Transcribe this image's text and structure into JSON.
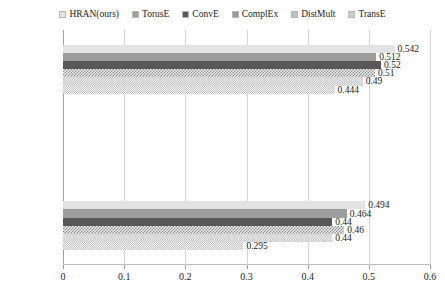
{
  "chart_data": {
    "type": "bar",
    "orientation": "horizontal",
    "title": "",
    "xlabel": "",
    "ylabel": "",
    "categories": [
      "hit@10",
      "hit@3",
      "hit@1"
    ],
    "series": [
      {
        "name": "HRAN(ours)",
        "values": [
          0.542,
          0.494,
          0.45
        ],
        "labels": [
          "0.542",
          "0.494",
          "0.45"
        ],
        "color": "#e3e3e3"
      },
      {
        "name": "TorusE",
        "values": [
          0.512,
          0.464,
          0.422
        ],
        "labels": [
          "0.512",
          "0.464",
          "0.422"
        ],
        "color": "#9d9d9d"
      },
      {
        "name": "ConvE",
        "values": [
          0.52,
          0.44,
          0.4
        ],
        "labels": [
          "0.52",
          "0.44",
          "0.4"
        ],
        "color": "#585858"
      },
      {
        "name": "ComplEx",
        "values": [
          0.51,
          0.46,
          0.41
        ],
        "labels": [
          "0.51",
          "0.46",
          "0.41"
        ],
        "color": "#8e8e8e"
      },
      {
        "name": "DistMult",
        "values": [
          0.49,
          0.44,
          0.39
        ],
        "labels": [
          "0.49",
          "0.44",
          "0.39"
        ],
        "color": "#b9b9b9"
      },
      {
        "name": "TransE",
        "values": [
          0.444,
          0.295,
          0.027
        ],
        "labels": [
          "0.444",
          "0.295",
          "0.027"
        ],
        "color": "#c6c6c6"
      }
    ],
    "xlim": [
      0,
      0.6
    ],
    "xticks": [
      0,
      0.1,
      0.2,
      0.3,
      0.4,
      0.5,
      0.6
    ],
    "xtick_labels": [
      "0",
      "0.1",
      "0.2",
      "0.3",
      "0.4",
      "0.5",
      "0.6"
    ],
    "grid": true,
    "grid_axis": "x",
    "legend_position": "top"
  }
}
